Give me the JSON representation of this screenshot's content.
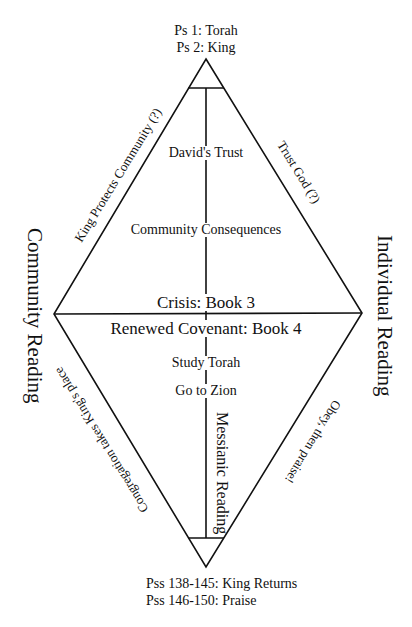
{
  "top_labels": [
    "Ps 1: Torah",
    "Ps 2: King"
  ],
  "bottom_labels": [
    "Pss 138-145: King Returns",
    "Pss 146-150: Praise"
  ],
  "side_labels": {
    "left": "Community Reading",
    "right": "Individual Reading"
  },
  "upper_center": {
    "first": "David's Trust",
    "second": "Community Consequences"
  },
  "middle": {
    "crisis": "Crisis: Book 3",
    "renewed": "Renewed Covenant: Book 4"
  },
  "lower_center": {
    "first": "Study Torah",
    "second": "Go to Zion",
    "vertical": "Messianic Reading"
  },
  "edge_labels": {
    "upper_left": "King Protects Community (?)",
    "upper_right": "Trust God (?)",
    "lower_left": "Congregation takes King's place",
    "lower_right": "Obey, then praise!"
  },
  "colors": {
    "line": "#111111",
    "text": "#111111",
    "background": "#ffffff"
  }
}
